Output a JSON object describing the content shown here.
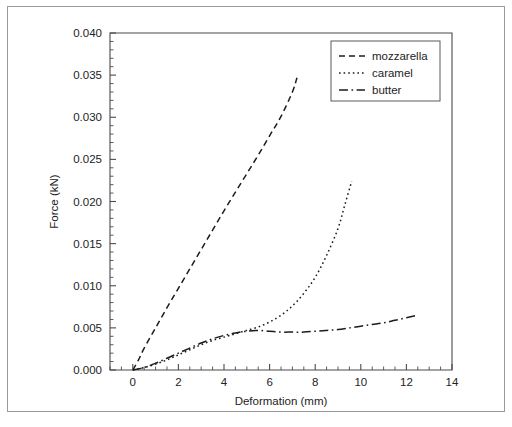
{
  "figure": {
    "background_color": "#ffffff",
    "frame_color": "#9a9a9a",
    "line_color": "#1c1c1c"
  },
  "chart_data": {
    "type": "line",
    "title": "",
    "xlabel": "Deformation (mm)",
    "ylabel": "Force (kN)",
    "xlim": [
      -1.0,
      14.0
    ],
    "ylim": [
      0.0,
      0.04
    ],
    "xticks": [
      0,
      2,
      4,
      6,
      8,
      10,
      12,
      14
    ],
    "xticklabels": [
      "0",
      "2",
      "4",
      "6",
      "8",
      "10",
      "12",
      "14"
    ],
    "yticks": [
      0.0,
      0.005,
      0.01,
      0.015,
      0.02,
      0.025,
      0.03,
      0.035,
      0.04
    ],
    "yticklabels": [
      "0.000",
      "0.005",
      "0.010",
      "0.015",
      "0.020",
      "0.025",
      "0.030",
      "0.035",
      "0.040"
    ],
    "x_minor_tick_interval": 0.5,
    "y_minor_tick_interval": 0.001,
    "grid": false,
    "legend_position": "upper right",
    "series": [
      {
        "name": "mozzarella",
        "linestyle": "dashed",
        "points": [
          [
            0.0,
            0.0
          ],
          [
            0.25,
            0.0012
          ],
          [
            0.5,
            0.0026
          ],
          [
            1.0,
            0.005
          ],
          [
            1.5,
            0.0074
          ],
          [
            2.0,
            0.0097
          ],
          [
            2.5,
            0.012
          ],
          [
            3.0,
            0.0143
          ],
          [
            3.5,
            0.0166
          ],
          [
            4.0,
            0.0189
          ],
          [
            4.5,
            0.0211
          ],
          [
            5.0,
            0.0233
          ],
          [
            5.5,
            0.0255
          ],
          [
            6.0,
            0.0278
          ],
          [
            6.5,
            0.0301
          ],
          [
            7.0,
            0.033
          ],
          [
            7.2,
            0.0347
          ]
        ]
      },
      {
        "name": "caramel",
        "linestyle": "dotted",
        "points": [
          [
            0.0,
            0.0
          ],
          [
            0.5,
            0.0003
          ],
          [
            1.0,
            0.0007
          ],
          [
            1.5,
            0.0012
          ],
          [
            2.0,
            0.0018
          ],
          [
            2.5,
            0.0024
          ],
          [
            3.0,
            0.003
          ],
          [
            3.5,
            0.0035
          ],
          [
            4.0,
            0.0039
          ],
          [
            4.5,
            0.0043
          ],
          [
            5.0,
            0.0047
          ],
          [
            5.5,
            0.0051
          ],
          [
            6.0,
            0.0057
          ],
          [
            6.5,
            0.0065
          ],
          [
            7.0,
            0.0076
          ],
          [
            7.5,
            0.0091
          ],
          [
            8.0,
            0.011
          ],
          [
            8.5,
            0.0136
          ],
          [
            9.0,
            0.0168
          ],
          [
            9.3,
            0.0196
          ],
          [
            9.6,
            0.0224
          ]
        ]
      },
      {
        "name": "butter",
        "linestyle": "dashdot",
        "points": [
          [
            0.0,
            0.0
          ],
          [
            0.5,
            0.0003
          ],
          [
            1.0,
            0.0008
          ],
          [
            1.5,
            0.0014
          ],
          [
            2.0,
            0.002
          ],
          [
            2.5,
            0.0026
          ],
          [
            3.0,
            0.0032
          ],
          [
            3.5,
            0.0037
          ],
          [
            4.0,
            0.0041
          ],
          [
            4.5,
            0.0044
          ],
          [
            5.0,
            0.0046
          ],
          [
            5.5,
            0.0047
          ],
          [
            6.0,
            0.0046
          ],
          [
            6.5,
            0.0045
          ],
          [
            7.0,
            0.0045
          ],
          [
            7.5,
            0.0045
          ],
          [
            8.0,
            0.0046
          ],
          [
            8.5,
            0.0047
          ],
          [
            9.0,
            0.0048
          ],
          [
            9.5,
            0.005
          ],
          [
            10.0,
            0.0052
          ],
          [
            10.5,
            0.0054
          ],
          [
            11.0,
            0.0056
          ],
          [
            11.5,
            0.0059
          ],
          [
            12.0,
            0.0062
          ],
          [
            12.5,
            0.0065
          ]
        ]
      }
    ]
  },
  "legend": {
    "items": [
      {
        "label": "mozzarella",
        "style": "dashed"
      },
      {
        "label": "caramel",
        "style": "dotted"
      },
      {
        "label": "butter",
        "style": "dashdot"
      }
    ]
  }
}
